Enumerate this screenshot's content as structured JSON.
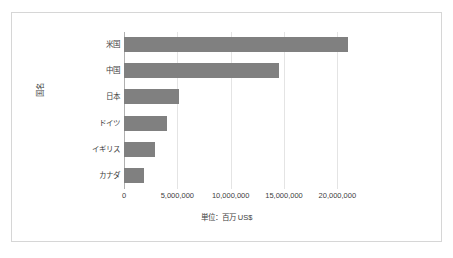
{
  "chart_data": {
    "type": "bar",
    "orientation": "horizontal",
    "title": "",
    "xlabel": "単位：百万 US$",
    "ylabel": "国名",
    "categories": [
      "米国",
      "中国",
      "日本",
      "ドイツ",
      "イギリス",
      "カナダ"
    ],
    "values": [
      21000000,
      14500000,
      5200000,
      4000000,
      2900000,
      1900000
    ],
    "series": [
      {
        "name": "GDP",
        "values": [
          21000000,
          14500000,
          5200000,
          4000000,
          2900000,
          1900000
        ]
      }
    ],
    "xlim": [
      0,
      22500000
    ],
    "xticks": [
      0,
      5000000,
      10000000,
      15000000,
      20000000
    ],
    "xticklabels": [
      "0",
      "5,000,000",
      "10,000,000",
      "15,000,000",
      "20,000,000"
    ],
    "grid": true,
    "gridlines": "vertical",
    "legend": false,
    "legend_position": "none",
    "bar_color": "#808080",
    "gridline_color": "#e4e4e4",
    "axis_color": "#b0b0b0",
    "border_color": "#d6d6d6",
    "background_color": "#ffffff",
    "text_color": "#404040"
  }
}
